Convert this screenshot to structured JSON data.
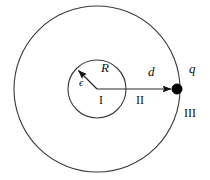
{
  "figure": {
    "kind": "physics-diagram",
    "colors": {
      "stroke": "#3a3a3a",
      "fill_dot": "#000000",
      "background": "#ffffff",
      "text": "#111111"
    },
    "geometry": {
      "center_x": 97,
      "center_y": 89,
      "outer_circle_radius": 83,
      "inner_circle_radius": 29,
      "charge_x": 177,
      "charge_y": 89,
      "charge_dot_radius": 5,
      "radius_arrow_angle_deg": 135
    },
    "labels": {
      "radius": "R",
      "permittivity": "ϵ",
      "region_inner": "I",
      "distance": "d",
      "region_middle": "II",
      "charge": "q",
      "region_outer": "III"
    }
  }
}
